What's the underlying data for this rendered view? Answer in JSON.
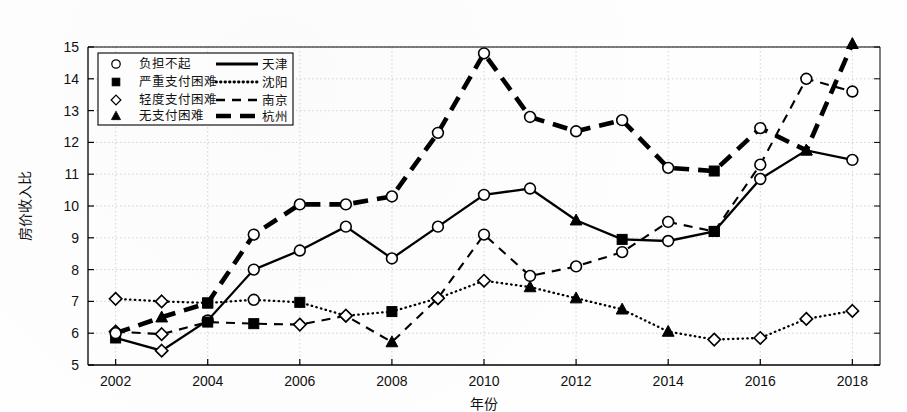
{
  "chart_data": {
    "type": "line",
    "title": "",
    "xlabel": "年份",
    "ylabel": "房价收入比",
    "xlim": [
      2001.4,
      2018.6
    ],
    "ylim": [
      5,
      15
    ],
    "yticks": [
      5,
      6,
      7,
      8,
      9,
      10,
      11,
      12,
      13,
      14,
      15
    ],
    "xticks": [
      2002,
      2004,
      2006,
      2008,
      2010,
      2012,
      2014,
      2016,
      2018
    ],
    "x": [
      2002,
      2003,
      2004,
      2005,
      2006,
      2007,
      2008,
      2009,
      2010,
      2011,
      2012,
      2013,
      2014,
      2015,
      2016,
      2017,
      2018
    ],
    "grid": true,
    "legend_position": "upper-left",
    "marker_legend": [
      {
        "marker": "circle-open",
        "label": "负担不起"
      },
      {
        "marker": "square-filled",
        "label": "严重支付困难"
      },
      {
        "marker": "diamond-open",
        "label": "轻度支付困难"
      },
      {
        "marker": "triangle-filled",
        "label": "无支付困难"
      }
    ],
    "line_legend": [
      {
        "style": "solid-thick",
        "label": "天津"
      },
      {
        "style": "dotted",
        "label": "沈阳"
      },
      {
        "style": "dashed",
        "label": "南京"
      },
      {
        "style": "thick-dashed",
        "label": "杭州"
      }
    ],
    "series": [
      {
        "name": "天津",
        "style": "solid-thick",
        "values": [
          5.85,
          5.45,
          6.4,
          8.0,
          8.6,
          9.35,
          8.35,
          9.35,
          10.35,
          10.55,
          9.55,
          8.95,
          8.9,
          9.2,
          10.85,
          11.75,
          11.45
        ],
        "markers": [
          "square-filled",
          "diamond-open",
          "circle-open",
          "circle-open",
          "circle-open",
          "circle-open",
          "circle-open",
          "circle-open",
          "circle-open",
          "circle-open",
          "triangle-filled",
          "square-filled",
          "circle-open",
          "square-filled",
          "circle-open",
          "triangle-filled",
          "circle-open"
        ]
      },
      {
        "name": "沈阳",
        "style": "dotted",
        "values": [
          7.08,
          7.0,
          6.95,
          7.05,
          6.97,
          6.55,
          6.68,
          7.1,
          7.65,
          7.45,
          7.1,
          6.75,
          6.05,
          5.8,
          5.85,
          6.45,
          6.7
        ],
        "markers": [
          "diamond-open",
          "diamond-open",
          "square-filled",
          "circle-open",
          "square-filled",
          "diamond-open",
          "square-filled",
          "diamond-open",
          "diamond-open",
          "triangle-filled",
          "triangle-filled",
          "triangle-filled",
          "triangle-filled",
          "diamond-open",
          "diamond-open",
          "diamond-open",
          "diamond-open"
        ]
      },
      {
        "name": "南京",
        "style": "dashed",
        "values": [
          6.05,
          5.97,
          6.35,
          6.3,
          6.27,
          6.55,
          5.72,
          7.1,
          9.1,
          7.8,
          8.1,
          8.55,
          9.5,
          9.2,
          11.3,
          14.0,
          13.6
        ],
        "markers": [
          "diamond-open",
          "diamond-open",
          "square-filled",
          "square-filled",
          "diamond-open",
          "diamond-open",
          "triangle-filled",
          "diamond-open",
          "circle-open",
          "circle-open",
          "circle-open",
          "circle-open",
          "circle-open",
          "square-filled",
          "circle-open",
          "circle-open",
          "circle-open"
        ]
      },
      {
        "name": "杭州",
        "style": "thick-dashed",
        "values": [
          6.0,
          6.5,
          6.95,
          9.1,
          10.05,
          10.05,
          10.3,
          12.3,
          14.8,
          12.8,
          12.35,
          12.7,
          11.2,
          11.1,
          12.45,
          11.75,
          15.1
        ],
        "markers": [
          "circle-open",
          "triangle-filled",
          "square-filled",
          "circle-open",
          "circle-open",
          "circle-open",
          "circle-open",
          "circle-open",
          "circle-open",
          "circle-open",
          "circle-open",
          "circle-open",
          "circle-open",
          "square-filled",
          "circle-open",
          "triangle-filled",
          "triangle-filled"
        ]
      }
    ]
  }
}
